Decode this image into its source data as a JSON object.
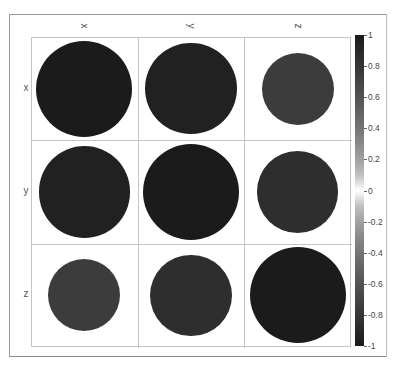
{
  "chart_data": {
    "type": "heatmap",
    "subtype": "correlation-circle-matrix",
    "title": "",
    "variables": [
      "x",
      "y",
      "z"
    ],
    "column_labels": [
      "x",
      "y",
      "z"
    ],
    "row_labels": [
      "x",
      "y",
      "z"
    ],
    "matrix": [
      [
        1.0,
        0.95,
        0.75
      ],
      [
        0.95,
        1.0,
        0.85
      ],
      [
        0.75,
        0.85,
        1.0
      ]
    ],
    "encoding": "circle radius and fill shade proportional to correlation value",
    "colorbar": {
      "min": -1,
      "max": 1,
      "ticks": [
        1,
        0.8,
        0.6,
        0.4,
        0.2,
        0,
        -0.2,
        -0.4,
        -0.6,
        -0.8,
        -1
      ],
      "tick_labels": [
        "1",
        "0.8",
        "0.6",
        "0.4",
        "0.2",
        "0",
        "-0.2",
        "-0.4",
        "-0.6",
        "-0.8",
        "-1"
      ],
      "colormap": "grayscale diverging: dark at -1 and 1, white at 0",
      "position": "right"
    },
    "grid": true,
    "colors": {
      "extreme": "#1b1b1b",
      "zero": "#ffffff",
      "grid_line": "#c4c4c4"
    }
  }
}
